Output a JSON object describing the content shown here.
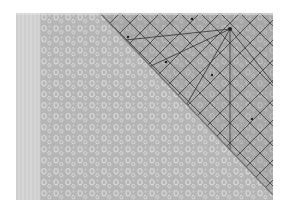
{
  "image": {
    "description": "Grayscale photograph of a small-scale paisley/floral printed fabric with a clear quilting ruler laid diagonally across the upper-right corner",
    "subject": "fabric with quilting ruler",
    "colors": {
      "background": "#ffffff",
      "fabric": "#b9b9b9",
      "fabric_motif": "#dcdcdc",
      "selvage": "#d2d2d2",
      "ruler_tint": "#9a9a9a",
      "ruler_lines": "#3c3c3c"
    },
    "regions": [
      {
        "name": "selvage-strip",
        "position": "left edge"
      },
      {
        "name": "fabric-print",
        "position": "center and lower-left"
      },
      {
        "name": "quilting-ruler",
        "position": "upper-right triangle"
      }
    ]
  }
}
